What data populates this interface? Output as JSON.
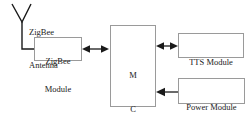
{
  "diagram": {
    "type": "block-diagram",
    "canvas": {
      "width": 247,
      "height": 116,
      "background": "#ffffff"
    },
    "style": {
      "box_border_color": "#9a9a9a",
      "box_fill": "#ffffff",
      "line_color": "#1a1a1a",
      "text_color": "#1a1a1a"
    },
    "blocks": [
      {
        "id": "zigbee-module",
        "label_lines": [
          "ZigBee",
          "Module"
        ],
        "x": 34,
        "y": 37,
        "w": 48,
        "h": 24
      },
      {
        "id": "mcu",
        "label_lines": [
          "M",
          "C",
          "U"
        ],
        "x": 110,
        "y": 25,
        "w": 46,
        "h": 82
      },
      {
        "id": "tts-module",
        "label_lines": [
          "TTS Module"
        ],
        "x": 178,
        "y": 33,
        "w": 66,
        "h": 25
      },
      {
        "id": "power-module",
        "label_lines": [
          "Power Module"
        ],
        "x": 178,
        "y": 78,
        "w": 67,
        "h": 26
      }
    ],
    "antenna": {
      "id": "zigbee-antenna",
      "label_lines": [
        "ZigBee",
        "Antenna"
      ],
      "apex_x": 22,
      "apex_y": 22,
      "left_tip_x": 12,
      "left_tip_y": 4,
      "right_tip_x": 31,
      "right_tip_y": 4,
      "stem_bottom_y": 49,
      "lead_to_x": 34
    },
    "connections": [
      {
        "id": "zigbee-to-mcu",
        "from": "zigbee-module",
        "to": "mcu",
        "direction": "bidirectional",
        "x1": 83,
        "x2": 108,
        "y": 49
      },
      {
        "id": "mcu-to-tts",
        "from": "mcu",
        "to": "tts-module",
        "direction": "bidirectional",
        "x1": 157,
        "x2": 177,
        "y": 46
      },
      {
        "id": "power-to-mcu",
        "from": "power-module",
        "to": "mcu",
        "direction": "unidirectional-left",
        "x1": 177,
        "x2": 157,
        "y": 92
      }
    ]
  }
}
